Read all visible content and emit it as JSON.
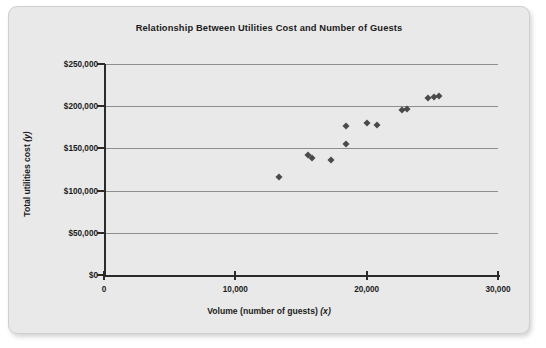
{
  "chart_data": {
    "type": "scatter",
    "title": "Relationship Between Utilities Cost and Number of Guests",
    "xlabel": "Volume (number of guests) (x)",
    "xlabel_text": "Volume (number of guests) ",
    "xlabel_var": "(x)",
    "ylabel": "Total utilities cost (y)",
    "ylabel_text": "Total utilities cost ",
    "ylabel_var": "(y)",
    "xlim": [
      0,
      30000
    ],
    "ylim": [
      0,
      250000
    ],
    "xticks": [
      0,
      10000,
      20000,
      30000
    ],
    "xtick_labels": [
      "0",
      "10,000",
      "20,000",
      "30,000"
    ],
    "yticks": [
      0,
      50000,
      100000,
      150000,
      200000,
      250000
    ],
    "ytick_labels": [
      "$0",
      "$50,000",
      "$100,000",
      "$150,000",
      "$200,000",
      "$250,000"
    ],
    "grid": "horizontal",
    "legend": "none",
    "marker": "diamond",
    "marker_color": "#4a4a4a",
    "plot_background": "#e9e9e9",
    "gridline_color": "#8e8e8e",
    "axis_color": "#2b2b2b",
    "points": [
      {
        "x": 13300,
        "y": 116000
      },
      {
        "x": 15500,
        "y": 142000
      },
      {
        "x": 15800,
        "y": 139000
      },
      {
        "x": 17300,
        "y": 136000
      },
      {
        "x": 18400,
        "y": 176000
      },
      {
        "x": 18400,
        "y": 155000
      },
      {
        "x": 20000,
        "y": 180000
      },
      {
        "x": 20800,
        "y": 178000
      },
      {
        "x": 22700,
        "y": 196000
      },
      {
        "x": 23100,
        "y": 197000
      },
      {
        "x": 24700,
        "y": 210000
      },
      {
        "x": 25100,
        "y": 211000
      },
      {
        "x": 25500,
        "y": 212000
      }
    ]
  }
}
